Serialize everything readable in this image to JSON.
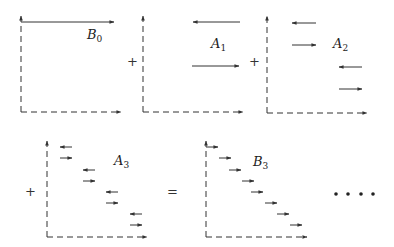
{
  "figure": {
    "panels": [
      {
        "id": "B0",
        "label": "B",
        "sub": "0",
        "axis_x": 21,
        "arrows": [
          {
            "x1": 21,
            "x2": 114,
            "y": 22,
            "dir": "right"
          }
        ],
        "label_x": 87,
        "label_y": 39
      },
      {
        "id": "A1",
        "label": "A",
        "sub": "1",
        "axis_x": 143,
        "arrows": [
          {
            "x1": 193,
            "x2": 240,
            "y": 22,
            "dir": "left"
          },
          {
            "x1": 192,
            "x2": 239,
            "y": 66,
            "dir": "right"
          }
        ],
        "label_x": 211,
        "label_y": 48
      },
      {
        "id": "A2",
        "label": "A",
        "sub": "2",
        "axis_x": 267,
        "arrows": [
          {
            "x1": 292,
            "x2": 316,
            "y": 23,
            "dir": "left"
          },
          {
            "x1": 292,
            "x2": 316,
            "y": 45,
            "dir": "right"
          },
          {
            "x1": 339,
            "x2": 362,
            "y": 67,
            "dir": "left"
          },
          {
            "x1": 339,
            "x2": 362,
            "y": 89,
            "dir": "right"
          }
        ],
        "label_x": 333,
        "label_y": 48
      },
      {
        "id": "A3",
        "label": "A",
        "sub": "3",
        "axis_x": 47,
        "arrows": [
          {
            "x1": 60,
            "x2": 72,
            "y": 147,
            "dir": "left"
          },
          {
            "x1": 60,
            "x2": 72,
            "y": 158,
            "dir": "right"
          },
          {
            "x1": 83,
            "x2": 95,
            "y": 170,
            "dir": "left"
          },
          {
            "x1": 83,
            "x2": 95,
            "y": 181,
            "dir": "right"
          },
          {
            "x1": 106,
            "x2": 118,
            "y": 192,
            "dir": "left"
          },
          {
            "x1": 106,
            "x2": 118,
            "y": 203,
            "dir": "right"
          },
          {
            "x1": 130,
            "x2": 142,
            "y": 214,
            "dir": "left"
          },
          {
            "x1": 130,
            "x2": 142,
            "y": 225,
            "dir": "right"
          }
        ],
        "label_x": 114,
        "label_y": 165
      },
      {
        "id": "B3",
        "label": "B",
        "sub": "3",
        "axis_x": 206,
        "arrows": [
          {
            "x1": 206,
            "x2": 218,
            "y": 147,
            "dir": "right"
          },
          {
            "x1": 219,
            "x2": 231,
            "y": 158,
            "dir": "right"
          },
          {
            "x1": 229,
            "x2": 241,
            "y": 170,
            "dir": "right"
          },
          {
            "x1": 242,
            "x2": 254,
            "y": 181,
            "dir": "right"
          },
          {
            "x1": 251,
            "x2": 263,
            "y": 192,
            "dir": "right"
          },
          {
            "x1": 265,
            "x2": 277,
            "y": 203,
            "dir": "right"
          },
          {
            "x1": 277,
            "x2": 289,
            "y": 214,
            "dir": "right"
          },
          {
            "x1": 290,
            "x2": 302,
            "y": 225,
            "dir": "right"
          }
        ],
        "label_x": 253,
        "label_y": 166
      }
    ],
    "operators": [
      {
        "symbol": "+",
        "x": 131,
        "y": 66
      },
      {
        "symbol": "+",
        "x": 253,
        "y": 66
      },
      {
        "symbol": "+",
        "x": 29,
        "y": 196
      },
      {
        "symbol": "=",
        "x": 172,
        "y": 196
      }
    ],
    "ellipsis": {
      "symbol": "• • • •",
      "dots_x": [
        336,
        348,
        361,
        373
      ],
      "y": 194
    }
  }
}
